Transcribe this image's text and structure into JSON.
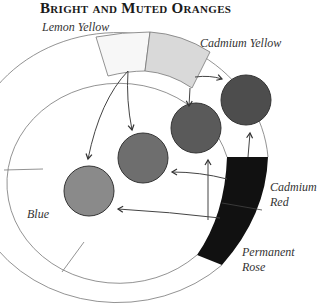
{
  "title": "Bright and Muted Oranges",
  "labels": {
    "lemon_yellow": "Lemon Yellow",
    "cadmium_yellow": "Cadmium Yellow",
    "cadmium_red_1": "Cadmium",
    "cadmium_red_2": "Red",
    "permanent_rose_1": "Permanent",
    "permanent_rose_2": "Rose",
    "blue": "Blue"
  },
  "colors": {
    "lemon_yellow": "#f7f7f7",
    "cadmium_yellow": "#d9d9d9",
    "red_band": "#111111",
    "swatch_1": "#8a8a8a",
    "swatch_2": "#6a6a6a",
    "swatch_3": "#555555",
    "swatch_4": "#4a4a4a"
  }
}
